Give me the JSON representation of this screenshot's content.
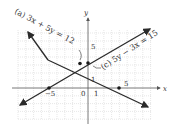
{
  "figure": {
    "type": "graph of two linear equations",
    "x_axis_label": "x",
    "y_axis_label": "y",
    "tick_labels": {
      "x_neg5": "−5",
      "x_0": "0",
      "x_1": "1",
      "x_5": "5",
      "y_1": "1",
      "y_5": "5"
    },
    "equations": [
      {
        "id": "a",
        "label": "(a) 3x + 5y = 12",
        "color": "#2a2a2a"
      },
      {
        "id": "c",
        "label": "(c) 5y − 3x = 15",
        "color": "#2a2a2a"
      }
    ],
    "grid_color": "#c8c8c8",
    "axis_color": "#555555"
  }
}
